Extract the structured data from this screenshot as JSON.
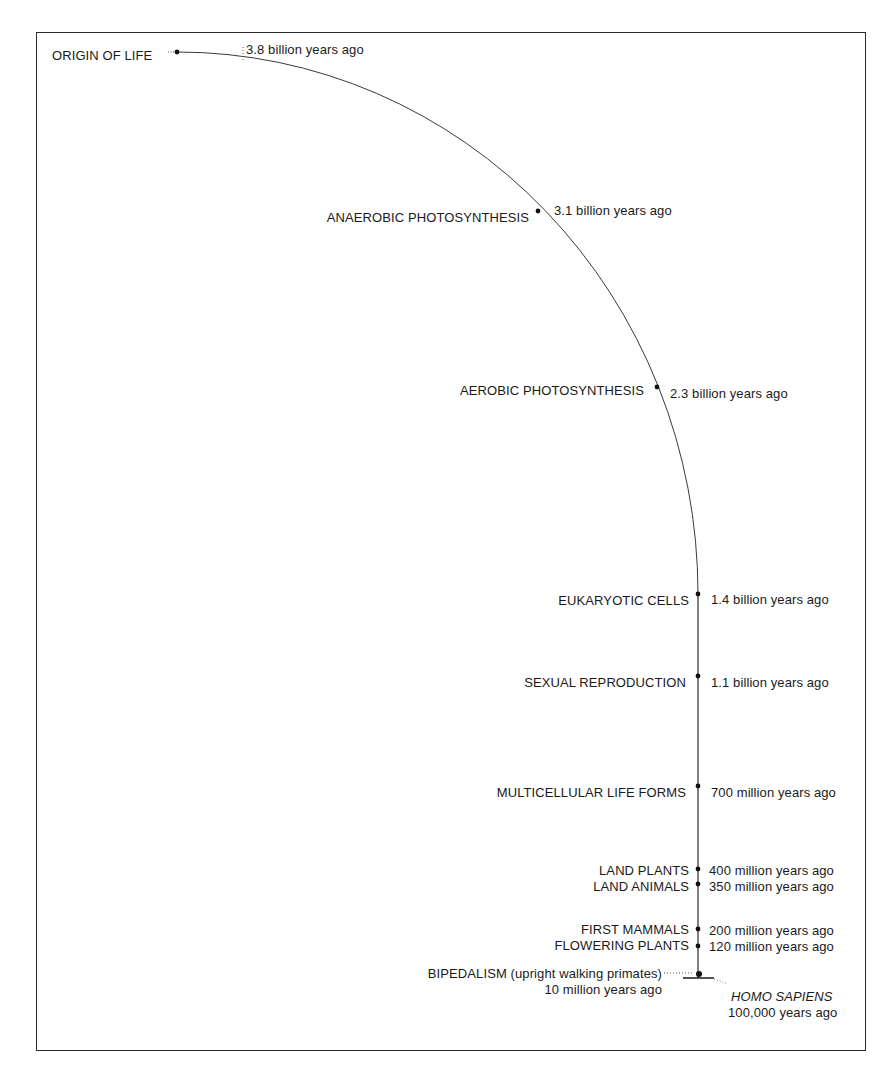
{
  "diagram": {
    "type": "timeline",
    "title": "",
    "colors": {
      "line": "#3a3a3a",
      "dot": "#111111",
      "text": "#1a1a1a",
      "frame": "#2a2a2a",
      "background": "#ffffff"
    },
    "events": [
      {
        "id": "origin_of_life",
        "event": "ORIGIN OF LIFE",
        "time": "3.8 billion years ago",
        "years_ago": 3800000000
      },
      {
        "id": "anaerobic_photosynthesis",
        "event": "ANAEROBIC PHOTOSYNTHESIS",
        "time": "3.1 billion years ago",
        "years_ago": 3100000000
      },
      {
        "id": "aerobic_photosynthesis",
        "event": "AEROBIC PHOTOSYNTHESIS",
        "time": "2.3 billion years ago",
        "years_ago": 2300000000
      },
      {
        "id": "eukaryotic_cells",
        "event": "EUKARYOTIC CELLS",
        "time": "1.4 billion years ago",
        "years_ago": 1400000000
      },
      {
        "id": "sexual_reproduction",
        "event": "SEXUAL REPRODUCTION",
        "time": "1.1 billion years ago",
        "years_ago": 1100000000
      },
      {
        "id": "multicellular_life_forms",
        "event": "MULTICELLULAR LIFE FORMS",
        "time": "700 million years ago",
        "years_ago": 700000000
      },
      {
        "id": "land_plants",
        "event": "LAND PLANTS",
        "time": "400 million years ago",
        "years_ago": 400000000
      },
      {
        "id": "land_animals",
        "event": "LAND ANIMALS",
        "time": "350 million years ago",
        "years_ago": 350000000
      },
      {
        "id": "first_mammals",
        "event": "FIRST MAMMALS",
        "time": "200 million years ago",
        "years_ago": 200000000
      },
      {
        "id": "flowering_plants",
        "event": "FLOWERING PLANTS",
        "time": "120 million years ago",
        "years_ago": 120000000
      },
      {
        "id": "bipedalism",
        "event": "BIPEDALISM (upright walking primates)",
        "time": "10 million years ago",
        "years_ago": 10000000
      },
      {
        "id": "homo_sapiens",
        "event": "HOMO SAPIENS",
        "time": "100,000 years ago",
        "years_ago": 100000
      }
    ]
  }
}
